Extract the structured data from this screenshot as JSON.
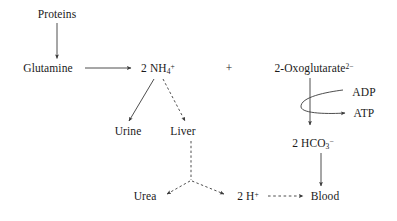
{
  "diagram": {
    "background_color": "#ffffff",
    "stroke_color": "#3a3a3a",
    "text_color": "#1a1a1a",
    "nodes": [
      {
        "id": "proteins",
        "label": "Proteins",
        "x": 57,
        "y": 14
      },
      {
        "id": "glutamine",
        "label": "Glutamine",
        "x": 48,
        "y": 68
      },
      {
        "id": "ammonium",
        "label_html": "2 NH<sub>4</sub><sup>+</sup>",
        "label": "2 NH4+",
        "x": 158,
        "y": 68
      },
      {
        "id": "oxoglutarate",
        "label_html": "2-Oxoglutarate<sup>2−</sup>",
        "label": "2-Oxoglutarate2-",
        "x": 314,
        "y": 68
      },
      {
        "id": "adp",
        "label": "ADP",
        "x": 364,
        "y": 92
      },
      {
        "id": "atp",
        "label": "ATP",
        "x": 364,
        "y": 113
      },
      {
        "id": "urine",
        "label": "Urine",
        "x": 128,
        "y": 131
      },
      {
        "id": "liver",
        "label": "Liver",
        "x": 183,
        "y": 131
      },
      {
        "id": "bicarbonate",
        "label_html": "2 HCO<sub>3</sub><sup>−</sup>",
        "label": "2 HCO3-",
        "x": 313,
        "y": 143
      },
      {
        "id": "urea",
        "label": "Urea",
        "x": 145,
        "y": 196
      },
      {
        "id": "protons",
        "label_html": "2 H<sup>+</sup>",
        "label": "2 H+",
        "x": 248,
        "y": 196
      },
      {
        "id": "blood",
        "label": "Blood",
        "x": 325,
        "y": 196
      }
    ],
    "operators": [
      {
        "id": "plus-operator",
        "label": "+",
        "x": 229,
        "y": 68
      }
    ],
    "edges": [
      {
        "id": "proteins-to-glutamine",
        "from": "proteins",
        "to": "glutamine",
        "style": "solid",
        "shape": "vertical"
      },
      {
        "id": "glutamine-to-ammonium",
        "from": "glutamine",
        "to": "ammonium",
        "style": "solid",
        "shape": "horizontal"
      },
      {
        "id": "ammonium-to-urine",
        "from": "ammonium",
        "to": "urine",
        "style": "solid",
        "shape": "diagonal"
      },
      {
        "id": "ammonium-to-liver",
        "from": "ammonium",
        "to": "liver",
        "style": "dashed",
        "shape": "diagonal"
      },
      {
        "id": "liver-to-branch",
        "from": "liver",
        "to": "branch-point",
        "style": "dashed",
        "shape": "vertical"
      },
      {
        "id": "branch-to-urea",
        "from": "branch-point",
        "to": "urea",
        "style": "dashed",
        "shape": "diagonal"
      },
      {
        "id": "branch-to-protons",
        "from": "branch-point",
        "to": "protons",
        "style": "dashed",
        "shape": "diagonal"
      },
      {
        "id": "protons-to-blood",
        "from": "protons",
        "to": "blood",
        "style": "dashed",
        "shape": "horizontal"
      },
      {
        "id": "oxoglutarate-to-bicarb",
        "from": "oxoglutarate",
        "to": "bicarbonate",
        "style": "solid",
        "shape": "vertical"
      },
      {
        "id": "adp-to-atp",
        "from": "adp",
        "to": "atp",
        "style": "solid",
        "shape": "curved"
      },
      {
        "id": "bicarbonate-to-blood",
        "from": "bicarbonate",
        "to": "blood",
        "style": "solid",
        "shape": "vertical"
      }
    ]
  }
}
